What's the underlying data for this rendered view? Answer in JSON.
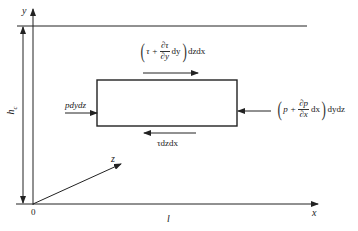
{
  "diagram": {
    "axes": {
      "y_label": "y",
      "x_label": "x",
      "z_label": "z",
      "origin_label": "0",
      "length_label": "l",
      "height_label": "h",
      "height_subscript": "c"
    },
    "forces": {
      "top_shear": {
        "open": "(",
        "lead": "τ +",
        "frac_num": "∂τ",
        "frac_den": "∂y",
        "tail": "dy",
        "close": ")",
        "suffix": "dzdx"
      },
      "bottom_shear": {
        "label": "τdzdx"
      },
      "left_pressure": {
        "label": "pdydz"
      },
      "right_pressure": {
        "open": "(",
        "lead": "p +",
        "frac_num": "∂p",
        "frac_den": "∂x",
        "tail": "dx",
        "close": ")",
        "suffix": "dydz"
      }
    },
    "colors": {
      "line": "#222222",
      "background": "#ffffff"
    }
  }
}
